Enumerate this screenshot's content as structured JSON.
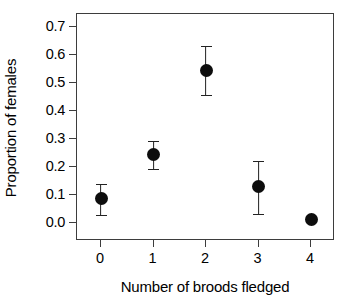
{
  "chart_data": {
    "type": "scatter",
    "title": "",
    "subtitle": "",
    "xlabel": "Number of broods fledged",
    "ylabel": "Proportion of females",
    "x": [
      0,
      1,
      2,
      3,
      4
    ],
    "xtick_labels": [
      "0",
      "1",
      "2",
      "3",
      "4"
    ],
    "ytick_labels": [
      "0.0",
      "0.1",
      "0.2",
      "0.3",
      "0.4",
      "0.5",
      "0.6",
      "0.7"
    ],
    "ytick_values": [
      0.0,
      0.1,
      0.2,
      0.3,
      0.4,
      0.5,
      0.6,
      0.7
    ],
    "values": [
      0.086,
      0.243,
      0.545,
      0.129,
      0.014
    ],
    "error_low": [
      0.028,
      0.193,
      0.457,
      0.032,
      0.014
    ],
    "error_high": [
      0.14,
      0.292,
      0.632,
      0.222,
      0.014
    ],
    "errorbars": true,
    "grid": false,
    "legend": null,
    "legend_position": "none",
    "xlim": [
      -0.5,
      4.5
    ],
    "ylim": [
      -0.03,
      0.755
    ],
    "marker": "filled-circle",
    "marker_color": "#0d0d0d",
    "errorbar_color": "#222222",
    "axis_color": "#3d3d3d",
    "background_color": "#ffffff",
    "points": [
      {
        "label": "0",
        "x": 0,
        "y": 0.086,
        "low": 0.028,
        "high": 0.14
      },
      {
        "label": "1",
        "x": 1,
        "y": 0.243,
        "low": 0.193,
        "high": 0.292
      },
      {
        "label": "2",
        "x": 2,
        "y": 0.545,
        "low": 0.457,
        "high": 0.632
      },
      {
        "label": "3",
        "x": 3,
        "y": 0.129,
        "low": 0.032,
        "high": 0.222
      },
      {
        "label": "4",
        "x": 4,
        "y": 0.014,
        "low": 0.014,
        "high": 0.014
      }
    ]
  }
}
